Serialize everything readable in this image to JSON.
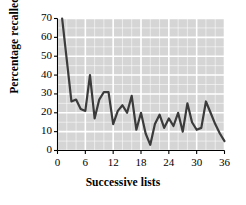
{
  "chart_data": {
    "type": "line",
    "title": "",
    "xlabel": "Successive lists",
    "ylabel": "Percentage recalled",
    "xlim": [
      0,
      36
    ],
    "ylim": [
      0,
      70
    ],
    "xticks": [
      0,
      6,
      12,
      18,
      24,
      30,
      36
    ],
    "yticks": [
      0,
      10,
      20,
      30,
      40,
      50,
      60,
      70
    ],
    "xtick_labels": [
      "0",
      "6",
      "12",
      "18",
      "24",
      "30",
      "36"
    ],
    "ytick_labels": [
      "0",
      "10",
      "20",
      "30",
      "40",
      "50",
      "60",
      "70"
    ],
    "grid": true,
    "grid_minor": true,
    "legend": null,
    "legend_position": "none",
    "plot_background": "#d5d5d5",
    "grid_color": "#ffffff",
    "line_color": "#3b3b3b",
    "line_width": 2.2,
    "x": [
      1,
      2,
      3,
      4,
      5,
      6,
      7,
      8,
      9,
      10,
      11,
      12,
      13,
      14,
      15,
      16,
      17,
      18,
      19,
      20,
      21,
      22,
      23,
      24,
      25,
      26,
      27,
      28,
      29,
      30,
      31,
      32,
      33,
      34,
      35,
      36
    ],
    "values": [
      70,
      48,
      26,
      27,
      22,
      21,
      40,
      17,
      27,
      31,
      31,
      14,
      21,
      24,
      20,
      29,
      11,
      20,
      9,
      3,
      14,
      19,
      12,
      17,
      13,
      20,
      10,
      25,
      15,
      11,
      12,
      26,
      20,
      14,
      9,
      5
    ],
    "series": [
      {
        "name": "Percentage recalled",
        "values": [
          70,
          48,
          26,
          27,
          22,
          21,
          40,
          17,
          27,
          31,
          31,
          14,
          21,
          24,
          20,
          29,
          11,
          20,
          9,
          3,
          14,
          19,
          12,
          17,
          13,
          20,
          10,
          25,
          15,
          11,
          12,
          26,
          20,
          14,
          9,
          5
        ]
      }
    ]
  }
}
